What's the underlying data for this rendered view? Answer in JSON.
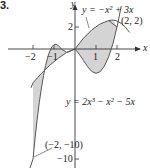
{
  "figure": {
    "number": "3.",
    "axes": {
      "x_label": "x",
      "y_label": "y"
    },
    "ticks": {
      "x": [
        "−2",
        "−1",
        "1",
        "2"
      ],
      "y": [
        "2",
        "−10"
      ]
    },
    "curves": [
      {
        "name": "parabola",
        "label": "y = −x² + 3x"
      },
      {
        "name": "cubic",
        "label": "y = 2x³ − x² − 5x"
      }
    ],
    "points": [
      {
        "label": "(2, 2)"
      },
      {
        "label": "(−2, −10)"
      }
    ],
    "colors": {
      "shade": "#d4d4d4",
      "curve": "#555555",
      "axis": "#333333"
    }
  }
}
